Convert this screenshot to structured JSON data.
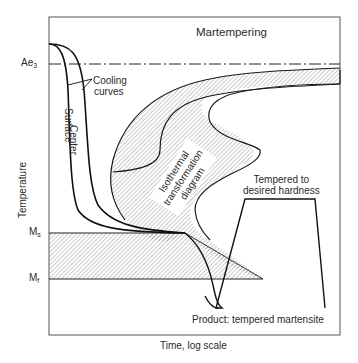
{
  "figure": {
    "title": "Martempering",
    "x_axis_label": "Time, log scale",
    "y_axis_label": "Temperature",
    "temperature_markers": {
      "ae3": {
        "base": "Ae",
        "sub": "3"
      },
      "ms": {
        "base": "M",
        "sub": "s"
      },
      "mf": {
        "base": "M",
        "sub": "f"
      }
    },
    "annotations": {
      "cooling_curves_line1": "Cooling",
      "cooling_curves_line2": "curves",
      "center": "Center",
      "surface": "Surface",
      "ittd_line1": "Isothermal",
      "ittd_line2": "transformation",
      "ittd_line3": "diagram",
      "tempered_line1": "Tempered to",
      "tempered_line2": "desired hardness",
      "product": "Product: tempered martensite"
    },
    "colors": {
      "line": "#1a1a1a",
      "hatch": "#8a8a8a",
      "frame": "#555555",
      "background": "#ffffff"
    }
  }
}
